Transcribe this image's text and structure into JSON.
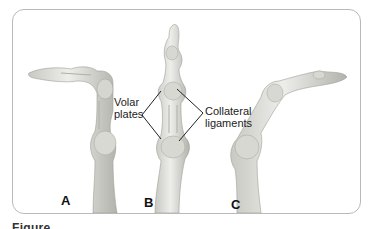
{
  "figure": {
    "panels": [
      {
        "letter": "A",
        "description": "finger flexed at proximal joint, distal segment bent horizontally left"
      },
      {
        "letter": "B",
        "description": "finger straight, vertical"
      },
      {
        "letter": "C",
        "description": "finger flexed, distal segment extending right"
      }
    ],
    "annotations": {
      "volar_plates_line1": "Volar",
      "volar_plates_line2": "plates",
      "collateral_line1": "Collateral",
      "collateral_line2": "ligaments"
    },
    "caption": "Figure"
  },
  "colors": {
    "bone_fill": "#e6e6e2",
    "bone_shade": "#b8b8b2",
    "frame_border": "#b9b9b9",
    "label_text": "#222222"
  }
}
